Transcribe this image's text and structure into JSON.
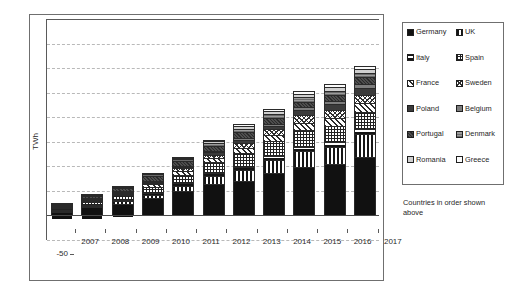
{
  "chart_data": {
    "type": "bar",
    "stacked": true,
    "title": "",
    "xlabel": "",
    "ylabel": "TWh",
    "ylim": [
      -50,
      400
    ],
    "ytick_values": [
      400,
      350,
      300,
      250,
      200,
      150,
      100,
      50,
      0,
      -50
    ],
    "ytick_labels": [
      "400",
      "350",
      "300",
      "250",
      "200",
      "150",
      "100",
      "50",
      "0",
      "-50"
    ],
    "grid": true,
    "grid_axis": "y",
    "legend_position": "right-outside",
    "legend_note": "Countries in order shown above",
    "categories": [
      "2007",
      "2008",
      "2009",
      "2010",
      "2011",
      "2012",
      "2013",
      "2014",
      "2015",
      "2016",
      "2017"
    ],
    "series": [
      {
        "name": "Germany",
        "pattern": "solid-black",
        "values": [
          11,
          21,
          26,
          36,
          50,
          64,
          70,
          86,
          98,
          105,
          119
        ]
      },
      {
        "name": "UK",
        "pattern": "vertical-stripes",
        "values": [
          2,
          3,
          5,
          6,
          11,
          17,
          22,
          26,
          33,
          35,
          46
        ]
      },
      {
        "name": "Italy",
        "pattern": "horizontal-stripes",
        "values": [
          1,
          2,
          3,
          4,
          5,
          6,
          7,
          8,
          9,
          9,
          10
        ]
      },
      {
        "name": "Spain",
        "pattern": "cross-hatch-fine",
        "values": [
          4,
          6,
          9,
          13,
          17,
          21,
          28,
          31,
          33,
          34,
          35
        ]
      },
      {
        "name": "France",
        "pattern": "diagonal-hatch",
        "values": [
          1,
          2,
          3,
          5,
          7,
          9,
          11,
          13,
          15,
          16,
          18
        ]
      },
      {
        "name": "Sweden",
        "pattern": "diagonal-cross",
        "values": [
          1,
          1,
          2,
          3,
          6,
          7,
          10,
          11,
          16,
          15,
          17
        ]
      },
      {
        "name": "Poland",
        "pattern": "dark-gray",
        "values": [
          0,
          1,
          1,
          2,
          3,
          5,
          6,
          7,
          10,
          12,
          14
        ]
      },
      {
        "name": "Belgium",
        "pattern": "mid-gray",
        "values": [
          0,
          1,
          1,
          2,
          2,
          3,
          4,
          5,
          6,
          7,
          9
        ]
      },
      {
        "name": "Portugal",
        "pattern": "dark-texture",
        "values": [
          2,
          3,
          5,
          9,
          9,
          10,
          12,
          12,
          12,
          12,
          13
        ]
      },
      {
        "name": "Denmark",
        "pattern": "gray-texture",
        "values": [
          2,
          3,
          3,
          4,
          5,
          6,
          7,
          8,
          9,
          9,
          10
        ]
      },
      {
        "name": "Romania",
        "pattern": "light-gray",
        "values": [
          0,
          0,
          0,
          0,
          2,
          3,
          5,
          6,
          7,
          7,
          7
        ]
      },
      {
        "name": "Greece",
        "pattern": "white",
        "values": [
          1,
          1,
          2,
          2,
          3,
          3,
          4,
          4,
          5,
          6,
          6
        ]
      }
    ],
    "totals": [
      25,
      44,
      60,
      86,
      120,
      154,
      186,
      217,
      253,
      267,
      304
    ]
  },
  "axis": {
    "y_title": "TWh"
  },
  "legend": {
    "items": [
      {
        "label": "Germany",
        "pattern": "solid-black"
      },
      {
        "label": "UK",
        "pattern": "vertical-stripes"
      },
      {
        "label": "Italy",
        "pattern": "horizontal-stripes"
      },
      {
        "label": "Spain",
        "pattern": "cross-hatch-fine"
      },
      {
        "label": "France",
        "pattern": "diagonal-hatch"
      },
      {
        "label": "Sweden",
        "pattern": "diagonal-cross"
      },
      {
        "label": "Poland",
        "pattern": "dark-gray"
      },
      {
        "label": "Belgium",
        "pattern": "mid-gray"
      },
      {
        "label": "Portugal",
        "pattern": "dark-texture"
      },
      {
        "label": "Denmark",
        "pattern": "gray-texture"
      },
      {
        "label": "Romania",
        "pattern": "light-gray"
      },
      {
        "label": "Greece",
        "pattern": "white"
      }
    ],
    "note": "Countries in order shown above"
  },
  "colors": {
    "frame": "#6f6f6f",
    "grid": "#b9b9b9",
    "axis": "#5a5a5a",
    "text": "#231f20"
  }
}
